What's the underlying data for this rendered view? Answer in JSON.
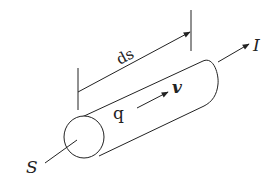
{
  "diagram": {
    "type": "current-element-cylinder",
    "labels": {
      "length": "ds",
      "charge": "q",
      "velocity": "v",
      "current": "I",
      "cross_section": "S"
    },
    "colors": {
      "stroke": "#222222",
      "background": "#ffffff"
    }
  }
}
